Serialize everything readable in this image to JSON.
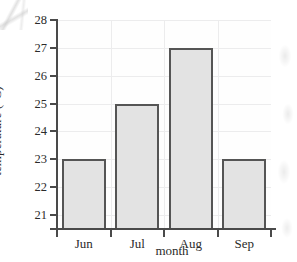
{
  "chart_data": {
    "type": "bar",
    "title": "",
    "xlabel": "month",
    "ylabel": "temperature (°C)",
    "categories": [
      "Jun",
      "Jul",
      "Aug",
      "Sep"
    ],
    "values": [
      23,
      25,
      27,
      23
    ],
    "series": [
      {
        "name": "temperature",
        "values": [
          23,
          25,
          27,
          23
        ]
      }
    ],
    "ylim": [
      20.5,
      28
    ],
    "yticks": [
      21,
      22,
      23,
      24,
      25,
      26,
      27,
      28
    ],
    "ytick_labels": [
      "21",
      "22",
      "23",
      "24",
      "25",
      "26",
      "27",
      "28"
    ],
    "grid": true,
    "legend": false,
    "bar_fill_color": "#e3e3e3",
    "bar_edge_color": "#555555",
    "axis_color": "#4a4a4a",
    "gridline_color": "#ececed",
    "background_color": "#ffffff"
  }
}
